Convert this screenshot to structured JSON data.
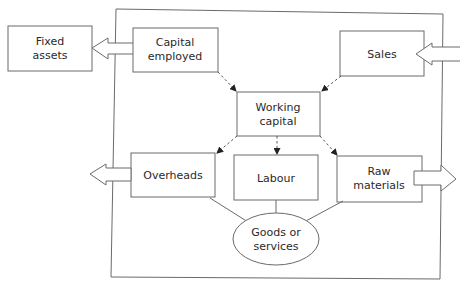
{
  "diagram": {
    "nodes": {
      "fixed_assets": {
        "line1": "Fixed",
        "line2": "assets"
      },
      "capital_employed": {
        "line1": "Capital",
        "line2": "employed"
      },
      "sales": {
        "line1": "Sales"
      },
      "working_capital": {
        "line1": "Working",
        "line2": "capital"
      },
      "overheads": {
        "line1": "Overheads"
      },
      "labour": {
        "line1": "Labour"
      },
      "raw_materials": {
        "line1": "Raw",
        "line2": "materials"
      },
      "goods_or_services": {
        "line1": "Goods or",
        "line2": "services"
      }
    },
    "edges": [
      {
        "from": "capital_employed",
        "to": "fixed_assets",
        "style": "hollow-arrow"
      },
      {
        "from": "external",
        "to": "sales",
        "style": "hollow-arrow"
      },
      {
        "from": "capital_employed",
        "to": "working_capital",
        "style": "dashed-arrow"
      },
      {
        "from": "sales",
        "to": "working_capital",
        "style": "dashed-arrow"
      },
      {
        "from": "working_capital",
        "to": "overheads",
        "style": "dashed-arrow"
      },
      {
        "from": "working_capital",
        "to": "labour",
        "style": "dashed-arrow"
      },
      {
        "from": "working_capital",
        "to": "raw_materials",
        "style": "dashed-arrow"
      },
      {
        "from": "overheads",
        "to": "external",
        "style": "hollow-arrow"
      },
      {
        "from": "raw_materials",
        "to": "external",
        "style": "hollow-arrow"
      },
      {
        "from": "overheads",
        "to": "goods_or_services",
        "style": "line"
      },
      {
        "from": "labour",
        "to": "goods_or_services",
        "style": "line"
      },
      {
        "from": "raw_materials",
        "to": "goods_or_services",
        "style": "line"
      }
    ]
  }
}
